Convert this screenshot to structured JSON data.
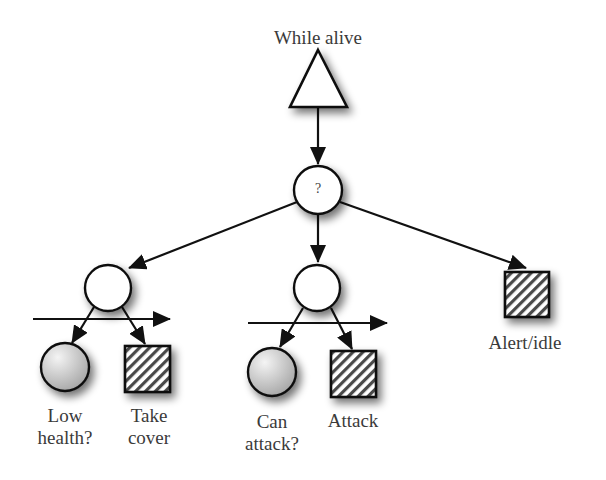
{
  "diagram": {
    "type": "behavior-tree",
    "root": {
      "label": "While alive",
      "shape": "triangle",
      "role": "loop-decorator"
    },
    "selector": {
      "label": "?",
      "shape": "circle",
      "role": "selector"
    },
    "branches": [
      {
        "shape": "circle",
        "role": "sequence",
        "children": [
          {
            "label_line1": "Low",
            "label_line2": "health?",
            "shape": "shaded-circle",
            "role": "condition"
          },
          {
            "label_line1": "Take",
            "label_line2": "cover",
            "shape": "hatched-square",
            "role": "action"
          }
        ]
      },
      {
        "shape": "circle",
        "role": "sequence",
        "children": [
          {
            "label_line1": "Can",
            "label_line2": "attack?",
            "shape": "shaded-circle",
            "role": "condition"
          },
          {
            "label_line1": "Attack",
            "label_line2": "",
            "shape": "hatched-square",
            "role": "action"
          }
        ]
      },
      {
        "label": "Alert/idle",
        "shape": "hatched-square",
        "role": "action"
      }
    ],
    "colors": {
      "stroke": "#111111",
      "fill": "#ffffff",
      "condition_fill_light": "#f2f2f2",
      "condition_fill_dark": "#a8a8a8",
      "hatch": "#444444",
      "text": "#3a3a3a"
    }
  }
}
